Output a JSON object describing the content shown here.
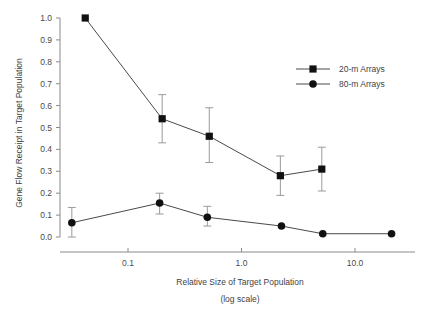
{
  "chart_data": {
    "type": "line",
    "title": "",
    "xlabel": "Relative Size of Target Population",
    "xlabel_sub": "(log scale)",
    "ylabel": "Gene Flow Receipt in Target Population",
    "xscale": "log",
    "xlim": [
      0.028,
      30
    ],
    "ylim": [
      0.0,
      1.0
    ],
    "grid": false,
    "legend_position": "upper-right",
    "x_ticks": [
      {
        "value": 0.1,
        "label": "0.1"
      },
      {
        "value": 1.0,
        "label": "1.0"
      },
      {
        "value": 10.0,
        "label": "10.0"
      }
    ],
    "y_ticks": [
      {
        "value": 0.0,
        "label": "0.0"
      },
      {
        "value": 0.1,
        "label": "0.1"
      },
      {
        "value": 0.2,
        "label": "0.2"
      },
      {
        "value": 0.3,
        "label": "0.3"
      },
      {
        "value": 0.4,
        "label": "0.4"
      },
      {
        "value": 0.5,
        "label": "0.5"
      },
      {
        "value": 0.6,
        "label": "0.6"
      },
      {
        "value": 0.7,
        "label": "0.7"
      },
      {
        "value": 0.8,
        "label": "0.8"
      },
      {
        "value": 0.9,
        "label": "0.9"
      },
      {
        "value": 1.0,
        "label": "1.0"
      }
    ],
    "series": [
      {
        "name": "20-m Arrays",
        "marker": "square",
        "color": "#111111",
        "x": [
          0.042,
          0.2,
          0.52,
          2.2,
          5.1
        ],
        "values": [
          1.0,
          0.54,
          0.46,
          0.28,
          0.31
        ],
        "err_low": [
          1.0,
          0.43,
          0.34,
          0.19,
          0.21
        ],
        "err_high": [
          1.0,
          0.65,
          0.59,
          0.37,
          0.41
        ]
      },
      {
        "name": "80-m Arrays",
        "marker": "circle",
        "color": "#111111",
        "x": [
          0.032,
          0.19,
          0.5,
          2.25,
          5.2,
          21.0
        ],
        "values": [
          0.065,
          0.155,
          0.09,
          0.05,
          0.015,
          0.015
        ],
        "err_low": [
          0.0,
          0.105,
          0.05,
          0.05,
          0.015,
          0.015
        ],
        "err_high": [
          0.135,
          0.2,
          0.14,
          0.05,
          0.015,
          0.015
        ]
      }
    ]
  },
  "legend": {
    "entries": [
      {
        "label": "20-m Arrays",
        "marker": "square"
      },
      {
        "label": "80-m Arrays",
        "marker": "circle"
      }
    ]
  }
}
